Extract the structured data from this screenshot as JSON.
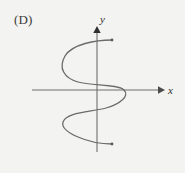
{
  "option": {
    "label": "(D)"
  },
  "figure": {
    "name": "rotated-sine-curve-graph",
    "background_color": "#f3f3f1",
    "curve_color": "#6b6b6b",
    "axis_color": "#6e6e6e",
    "text_color": "#3a3a3a"
  },
  "axes": {
    "x_label": "x",
    "y_label": "y",
    "origin": {
      "x": 97,
      "y": 90
    },
    "x_axis": {
      "start_x": 32,
      "end_x": 162,
      "y": 90,
      "arrow": "right"
    },
    "y_axis": {
      "x": 97,
      "start_y": 152,
      "end_y": 30,
      "arrow": "up"
    }
  },
  "chart_data": {
    "type": "line",
    "title": "",
    "xlabel": "x",
    "ylabel": "y",
    "grid": false,
    "legend": null,
    "relation": "x = A*sin(k*y)",
    "amplitude_px": 32,
    "endpoints": {
      "top": {
        "x": 112,
        "y": 40
      },
      "bottom": {
        "x": 112,
        "y": 144
      }
    },
    "extrema": [
      {
        "label": "upper-left-minimum",
        "x": 63,
        "y": 62
      },
      {
        "label": "right-maximum",
        "x": 127,
        "y": 90
      },
      {
        "label": "lower-left-minimum",
        "x": 63,
        "y": 120
      }
    ],
    "axis_crossings": [
      {
        "axis": "y-axis",
        "x": 97,
        "y": 75
      },
      {
        "axis": "x-axis",
        "x": 124,
        "y": 90
      },
      {
        "axis": "y-axis",
        "x": 97,
        "y": 106
      }
    ],
    "path": "M 112,40 C 96,40 72,44 65,56 C 58,68 64,78 78,82 C 92,86 118,84 124,90 C 130,96 120,104 106,108 C 92,112 66,112 63,122 C 60,132 88,144 112,144",
    "ylim": [
      30,
      152
    ],
    "xlim": [
      32,
      162
    ]
  }
}
